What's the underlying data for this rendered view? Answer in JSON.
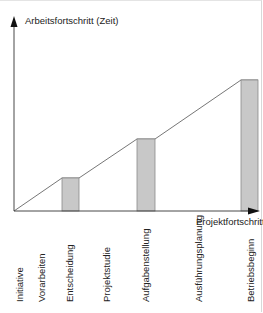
{
  "diagram": {
    "y_axis_label": "Arbeitsfortschritt (Zeit)",
    "x_axis_label": "Projektfortschritt",
    "phases": [
      {
        "label": "Initiative"
      },
      {
        "label": "Vorarbeiten"
      },
      {
        "label": "Entscheidung"
      },
      {
        "label": "Projektstudie"
      },
      {
        "label": "Aufgabenstellung"
      },
      {
        "label": "Ausführungsplanung"
      },
      {
        "label": "Betriebsbeginn"
      }
    ],
    "milestone_bars": [
      {
        "phase": "Entscheidung",
        "relative_height": 0.17
      },
      {
        "phase": "Aufgabenstellung",
        "relative_height": 0.37
      },
      {
        "phase": "Betriebsbeginn",
        "relative_height": 0.68
      }
    ],
    "colors": {
      "bar_fill": "#c8c8c8",
      "bar_stroke": "#888888",
      "axis": "#222222",
      "line": "#555555"
    }
  }
}
